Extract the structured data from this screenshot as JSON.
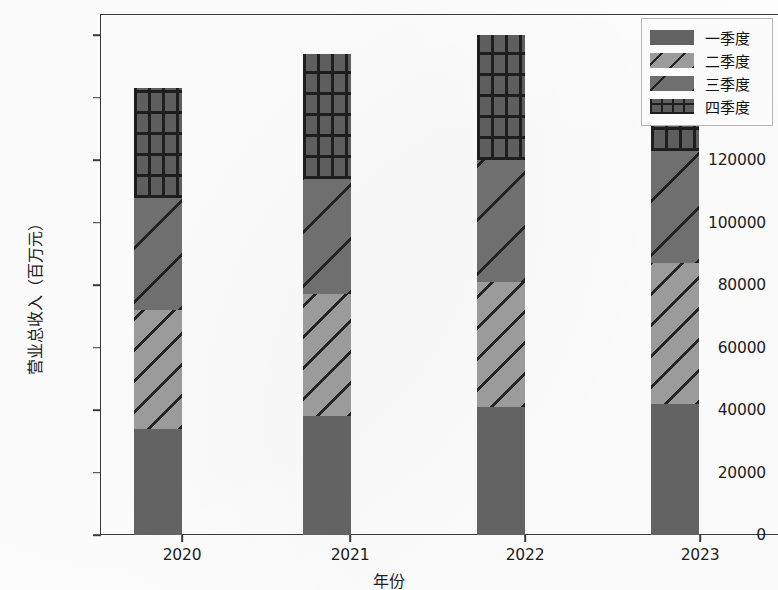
{
  "axes": {
    "y_title": "营业总收入（百万元）",
    "x_title": "年份",
    "y_ticks": [
      "0",
      "20000",
      "40000",
      "60000",
      "80000",
      "100000",
      "120000",
      "140000",
      "160000"
    ],
    "x_ticks": [
      "2020",
      "2021",
      "2022",
      "2023"
    ]
  },
  "legend": {
    "items": [
      {
        "label": "一季度",
        "pattern": "solid-fill",
        "color": "#636363"
      },
      {
        "label": "二季度",
        "pattern": "diagonal-hatch-light",
        "color": "#9b9b9b"
      },
      {
        "label": "三季度",
        "pattern": "diagonal-hatch-sparse",
        "color": "#6f6f6f"
      },
      {
        "label": "四季度",
        "pattern": "crosshatch-grid",
        "color": "#5e5e5e"
      }
    ]
  },
  "chart_data": {
    "type": "bar",
    "subtype": "stacked",
    "title": "",
    "xlabel": "年份",
    "ylabel": "营业总收入（百万元）",
    "categories": [
      "2020",
      "2021",
      "2022",
      "2023"
    ],
    "series": [
      {
        "name": "一季度",
        "values": [
          34000,
          38000,
          41000,
          42000
        ]
      },
      {
        "name": "二季度",
        "values": [
          38000,
          39000,
          40000,
          45000
        ]
      },
      {
        "name": "三季度",
        "values": [
          36000,
          37000,
          39000,
          36000
        ]
      },
      {
        "name": "四季度",
        "values": [
          35000,
          40000,
          40000,
          38000
        ]
      }
    ],
    "totals": [
      143000,
      154000,
      160000,
      161000
    ],
    "ylim": [
      0,
      170000
    ],
    "ytick_values": [
      0,
      20000,
      40000,
      60000,
      80000,
      100000,
      120000,
      140000,
      160000
    ],
    "grid": false,
    "legend_position": "upper right"
  }
}
